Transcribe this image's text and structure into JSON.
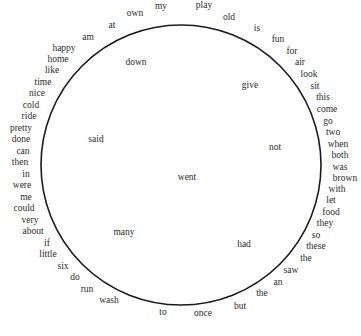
{
  "diagram": {
    "circle": {
      "cx": 181,
      "cy": 165,
      "r": 140,
      "stroke": "#1a1a1a"
    },
    "outer_words": [
      {
        "text": "my",
        "x": 161,
        "y": 7
      },
      {
        "text": "play",
        "x": 204,
        "y": 6
      },
      {
        "text": "own",
        "x": 135,
        "y": 14
      },
      {
        "text": "old",
        "x": 229,
        "y": 18
      },
      {
        "text": "at",
        "x": 112,
        "y": 26
      },
      {
        "text": "is",
        "x": 257,
        "y": 29
      },
      {
        "text": "am",
        "x": 88,
        "y": 38
      },
      {
        "text": "fun",
        "x": 278,
        "y": 40
      },
      {
        "text": "happy",
        "x": 64,
        "y": 49
      },
      {
        "text": "for",
        "x": 292,
        "y": 52
      },
      {
        "text": "home",
        "x": 58,
        "y": 60
      },
      {
        "text": "air",
        "x": 300,
        "y": 63
      },
      {
        "text": "like",
        "x": 52,
        "y": 71
      },
      {
        "text": "look",
        "x": 309,
        "y": 75
      },
      {
        "text": "time",
        "x": 43,
        "y": 83
      },
      {
        "text": "sit",
        "x": 315,
        "y": 87
      },
      {
        "text": "nice",
        "x": 37,
        "y": 94
      },
      {
        "text": "this",
        "x": 323,
        "y": 98
      },
      {
        "text": "cold",
        "x": 31,
        "y": 106
      },
      {
        "text": "come",
        "x": 327,
        "y": 110
      },
      {
        "text": "ride",
        "x": 29,
        "y": 117
      },
      {
        "text": "go",
        "x": 328,
        "y": 122
      },
      {
        "text": "pretty",
        "x": 21,
        "y": 129
      },
      {
        "text": "two",
        "x": 333,
        "y": 133
      },
      {
        "text": "done",
        "x": 21,
        "y": 140
      },
      {
        "text": "when",
        "x": 338,
        "y": 145
      },
      {
        "text": "can",
        "x": 23,
        "y": 152
      },
      {
        "text": "both",
        "x": 340,
        "y": 156
      },
      {
        "text": "then",
        "x": 20,
        "y": 163
      },
      {
        "text": "was",
        "x": 340,
        "y": 168
      },
      {
        "text": "in",
        "x": 26,
        "y": 175
      },
      {
        "text": "brown",
        "x": 345,
        "y": 179
      },
      {
        "text": "were",
        "x": 22,
        "y": 186
      },
      {
        "text": "with",
        "x": 337,
        "y": 190
      },
      {
        "text": "me",
        "x": 26,
        "y": 198
      },
      {
        "text": "let",
        "x": 331,
        "y": 201
      },
      {
        "text": "could",
        "x": 24,
        "y": 209
      },
      {
        "text": "food",
        "x": 331,
        "y": 213
      },
      {
        "text": "very",
        "x": 30,
        "y": 221
      },
      {
        "text": "they",
        "x": 325,
        "y": 224
      },
      {
        "text": "about",
        "x": 33,
        "y": 232
      },
      {
        "text": "so",
        "x": 316,
        "y": 236
      },
      {
        "text": "if",
        "x": 47,
        "y": 244
      },
      {
        "text": "these",
        "x": 316,
        "y": 247
      },
      {
        "text": "little",
        "x": 48,
        "y": 255
      },
      {
        "text": "the",
        "x": 306,
        "y": 259
      },
      {
        "text": "six",
        "x": 63,
        "y": 267
      },
      {
        "text": "saw",
        "x": 291,
        "y": 271
      },
      {
        "text": "do",
        "x": 75,
        "y": 278
      },
      {
        "text": "an",
        "x": 278,
        "y": 283
      },
      {
        "text": "run",
        "x": 87,
        "y": 290
      },
      {
        "text": "the",
        "x": 262,
        "y": 294
      },
      {
        "text": "wash",
        "x": 109,
        "y": 301
      },
      {
        "text": "but",
        "x": 240,
        "y": 307
      },
      {
        "text": "to",
        "x": 163,
        "y": 313
      },
      {
        "text": "once",
        "x": 203,
        "y": 314
      }
    ],
    "inner_words": [
      {
        "text": "down",
        "x": 136,
        "y": 63
      },
      {
        "text": "give",
        "x": 250,
        "y": 86
      },
      {
        "text": "said",
        "x": 96,
        "y": 140
      },
      {
        "text": "not",
        "x": 275,
        "y": 148
      },
      {
        "text": "went",
        "x": 187,
        "y": 178
      },
      {
        "text": "many",
        "x": 124,
        "y": 233
      },
      {
        "text": "had",
        "x": 244,
        "y": 245
      }
    ]
  }
}
